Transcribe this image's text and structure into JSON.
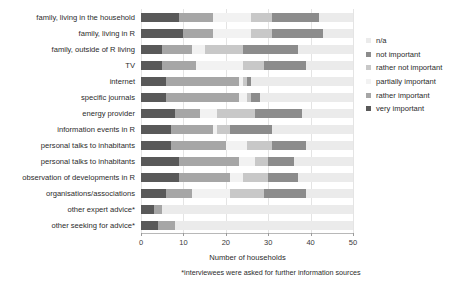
{
  "chart_data": {
    "type": "bar",
    "orientation": "horizontal",
    "stacked": true,
    "title": "",
    "xlabel": "Number of households",
    "ylabel": "",
    "xlim": [
      0,
      50
    ],
    "xticks": [
      0,
      10,
      20,
      30,
      40,
      50
    ],
    "xticklabels": [
      "0",
      "10",
      "20",
      "30",
      "40",
      "50"
    ],
    "grid": true,
    "legend_position": "right",
    "footnote": "*interviewees were asked for further information sources",
    "categories": [
      "family, living in the household",
      "family, living in R",
      "family, outside of R living",
      "TV",
      "internet",
      "specific journals",
      "energy provider",
      "information events in R",
      "personal talks to inhabitants",
      "personal talks to inhabitants",
      "observation of developments in R",
      "organisations/associations",
      "other expert advice*",
      "other seeking for advice*"
    ],
    "series": [
      {
        "name": "very important",
        "color": "#595959",
        "values": [
          9,
          10,
          5,
          5,
          6,
          6,
          8,
          7,
          7,
          9,
          9,
          6,
          3,
          4
        ]
      },
      {
        "name": "rather important",
        "color": "#a6a6a6",
        "values": [
          8,
          7,
          7,
          8,
          17,
          17,
          6,
          10,
          13,
          14,
          12,
          6,
          2,
          4
        ]
      },
      {
        "name": "partially important",
        "color": "#f2f2f2",
        "values": [
          9,
          9,
          3,
          11,
          1,
          2,
          4,
          1,
          5,
          4,
          3,
          9,
          0,
          0
        ]
      },
      {
        "name": "rather not important",
        "color": "#c8c8c8",
        "values": [
          5,
          5,
          9,
          5,
          1,
          1,
          9,
          3,
          6,
          3,
          6,
          8,
          0,
          0
        ]
      },
      {
        "name": "not important",
        "color": "#8c8c8c",
        "values": [
          11,
          12,
          13,
          10,
          1,
          2,
          11,
          10,
          8,
          6,
          7,
          10,
          0,
          0
        ]
      },
      {
        "name": "n/a",
        "color": "#ebebeb",
        "values": [
          8,
          7,
          13,
          11,
          24,
          22,
          12,
          19,
          11,
          14,
          13,
          11,
          45,
          42
        ]
      }
    ]
  },
  "legend": {
    "items": [
      {
        "label": "n/a",
        "color": "#ebebeb"
      },
      {
        "label": "not important",
        "color": "#8c8c8c"
      },
      {
        "label": "rather not important",
        "color": "#c8c8c8"
      },
      {
        "label": "partially important",
        "color": "#f2f2f2"
      },
      {
        "label": "rather important",
        "color": "#a6a6a6"
      },
      {
        "label": "very important",
        "color": "#595959"
      }
    ]
  },
  "axis": {
    "x_title": "Number of households"
  }
}
